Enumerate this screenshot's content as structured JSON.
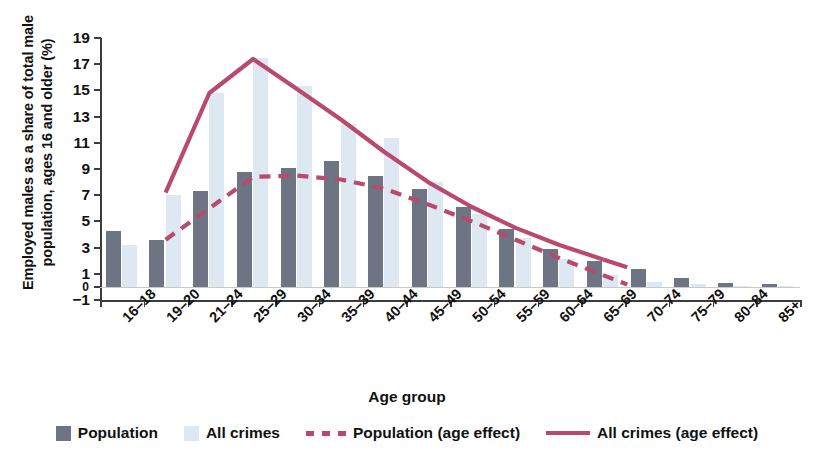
{
  "chart_data": {
    "type": "bar",
    "title": "",
    "xlabel": "Age group",
    "ylabel": "Employed males as a share of total male population, ages 16 and older (%)",
    "ylim": [
      -1,
      19
    ],
    "yticks": [
      19,
      17,
      15,
      13,
      11,
      9,
      7,
      5,
      3,
      1,
      0,
      -1
    ],
    "ytick_labels": [
      "19",
      "17",
      "15",
      "13",
      "11",
      "9",
      "7",
      "5",
      "3",
      "1",
      "0",
      "−1"
    ],
    "grid": false,
    "legend_position": "bottom",
    "categories": [
      "16–18",
      "19–20",
      "21–24",
      "25–29",
      "30–34",
      "35–39",
      "40–44",
      "45–49",
      "50–54",
      "55–59",
      "60–64",
      "65–69",
      "70–74",
      "75–79",
      "80–84",
      "85+"
    ],
    "series": [
      {
        "name": "Population",
        "kind": "bar",
        "color": "#6d7585",
        "values": [
          4.3,
          3.6,
          7.3,
          8.8,
          9.1,
          9.6,
          8.5,
          7.5,
          6.1,
          4.4,
          2.9,
          2.0,
          1.4,
          0.7,
          0.3,
          0.2
        ]
      },
      {
        "name": "All crimes",
        "kind": "bar",
        "color": "#dde8f2",
        "values": [
          3.2,
          7.0,
          14.8,
          17.5,
          15.3,
          12.4,
          11.4,
          8.0,
          5.6,
          3.7,
          2.1,
          0.9,
          0.4,
          0.2,
          0.1,
          0.1
        ]
      },
      {
        "name": "Population (age effect)",
        "kind": "line",
        "style": "dashed",
        "color": "#b94a6e",
        "values": [
          null,
          3.6,
          6.0,
          8.4,
          8.5,
          8.2,
          7.5,
          6.3,
          5.0,
          3.6,
          2.2,
          0.9,
          null,
          null,
          null,
          null
        ]
      },
      {
        "name": "All crimes (age effect)",
        "kind": "line",
        "style": "solid",
        "color": "#b94a6e",
        "values": [
          null,
          7.2,
          14.8,
          17.4,
          15.1,
          12.8,
          10.3,
          8.0,
          6.1,
          4.5,
          3.2,
          2.1,
          null,
          null,
          null,
          null
        ]
      }
    ]
  },
  "legend": {
    "items": [
      {
        "label": "Population",
        "swatch": "box",
        "color": "#6d7585"
      },
      {
        "label": "All crimes",
        "swatch": "box",
        "color": "#dde8f2"
      },
      {
        "label": "Population (age effect)",
        "swatch": "dash",
        "color": "#b94a6e"
      },
      {
        "label": "All crimes (age effect)",
        "swatch": "line",
        "color": "#b94a6e"
      }
    ]
  }
}
